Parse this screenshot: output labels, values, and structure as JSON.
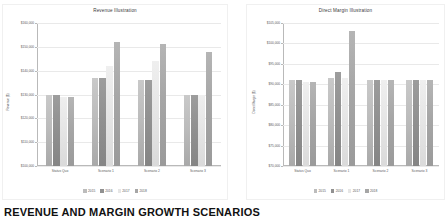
{
  "page": {
    "heading": "REVENUE AND MARGIN GROWTH SCENARIOS"
  },
  "charts": [
    {
      "id": "chart-revenue",
      "title": "Revenue Illustration",
      "ylabel": "Revenue ($)"
    },
    {
      "id": "chart-margin",
      "title": "Direct Margin Illustration",
      "ylabel": "Direct Margin ($)"
    }
  ],
  "chart_data": [
    {
      "type": "bar",
      "title": "Revenue Illustration",
      "xlabel": "",
      "ylabel": "Revenue ($)",
      "categories": [
        "Status Quo",
        "Scenario 1",
        "Scenario 2",
        "Scenario 3"
      ],
      "series": [
        {
          "name": "2015",
          "values": [
            130000,
            137000,
            136000,
            130000
          ]
        },
        {
          "name": "2016",
          "values": [
            130000,
            137000,
            136000,
            130000
          ]
        },
        {
          "name": "2017",
          "values": [
            129000,
            142000,
            144000,
            130000
          ]
        },
        {
          "name": "2018",
          "values": [
            129000,
            152000,
            151000,
            148000
          ]
        }
      ],
      "ylim": [
        100000,
        160000
      ],
      "yticks": [
        100000,
        110000,
        120000,
        130000,
        140000,
        150000,
        160000
      ],
      "ytick_labels": [
        "$100,000",
        "$110,000",
        "$120,000",
        "$130,000",
        "$140,000",
        "$150,000",
        "$160,000"
      ],
      "grid": true,
      "legend_position": "bottom"
    },
    {
      "type": "bar",
      "title": "Direct Margin Illustration",
      "xlabel": "",
      "ylabel": "Direct Margin ($)",
      "categories": [
        "Status Quo",
        "Scenario 1",
        "Scenario 2",
        "Scenario 3"
      ],
      "series": [
        {
          "name": "2015",
          "values": [
            91000,
            91500,
            91000,
            91000
          ]
        },
        {
          "name": "2016",
          "values": [
            91000,
            93000,
            91000,
            91000
          ]
        },
        {
          "name": "2017",
          "values": [
            90500,
            91500,
            91000,
            91000
          ]
        },
        {
          "name": "2018",
          "values": [
            90500,
            103000,
            91000,
            91000
          ]
        }
      ],
      "ylim": [
        70000,
        105000
      ],
      "yticks": [
        70000,
        75000,
        80000,
        85000,
        90000,
        95000,
        100000,
        105000
      ],
      "ytick_labels": [
        "$70,000",
        "$75,000",
        "$80,000",
        "$85,000",
        "$90,000",
        "$95,000",
        "$100,000",
        "$105,000"
      ],
      "grid": true,
      "legend_position": "bottom"
    }
  ]
}
